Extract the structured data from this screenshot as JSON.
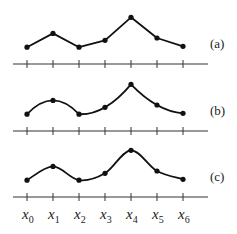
{
  "diagram": {
    "x_labels": [
      {
        "base": "x",
        "sub": "0"
      },
      {
        "base": "x",
        "sub": "1"
      },
      {
        "base": "x",
        "sub": "2"
      },
      {
        "base": "x",
        "sub": "3"
      },
      {
        "base": "x",
        "sub": "4"
      },
      {
        "base": "x",
        "sub": "5"
      },
      {
        "base": "x",
        "sub": "6"
      }
    ],
    "values": [
      0.3,
      0.6,
      0.3,
      0.45,
      0.95,
      0.5,
      0.32
    ],
    "panels": [
      {
        "label": "(a)",
        "interpolation": "piecewise-linear"
      },
      {
        "label": "(b)",
        "interpolation": "piecewise-quadratic"
      },
      {
        "label": "(c)",
        "interpolation": "cubic-spline"
      }
    ],
    "colors": {
      "curve": "#111111",
      "axis": "#333333"
    }
  }
}
